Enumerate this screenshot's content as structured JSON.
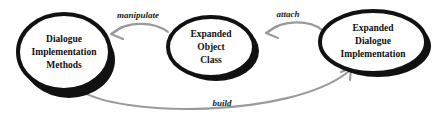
{
  "diagram": {
    "canvas": {
      "width": 432,
      "height": 125,
      "background": "#ffffff"
    },
    "style": {
      "node_stroke": "#111111",
      "node_fill": "#ffffff",
      "node_shadow": "#111111",
      "edge_color": "#9a9a9a",
      "text_color": "#101010"
    },
    "nodes": [
      {
        "id": "dialogue-implementation-methods",
        "shape": "ellipse",
        "cx": 64,
        "cy": 52,
        "rx": 46,
        "ry": 38,
        "lines": [
          "Dialogue",
          "Implementation",
          "Methods"
        ],
        "font_size": 9.5
      },
      {
        "id": "expanded-object-class",
        "shape": "ellipse",
        "cx": 211,
        "cy": 47,
        "rx": 43,
        "ry": 30,
        "lines": [
          "Expanded",
          "Object",
          "Class"
        ],
        "font_size": 9.5
      },
      {
        "id": "expanded-dialogue-implementation",
        "shape": "ellipse",
        "cx": 373,
        "cy": 42,
        "rx": 53,
        "ry": 31,
        "lines": [
          "Expanded",
          "Dialogue",
          "Implementation"
        ],
        "font_size": 9.5
      }
    ],
    "edges": [
      {
        "id": "manipulate",
        "label": "manipulate",
        "from": "expanded-object-class",
        "to": "dialogue-implementation-methods",
        "label_x": 138,
        "label_y": 16,
        "label_font_size": 9,
        "path": "M 168 32 C 155 22 128 20 113 33",
        "arrow": "M 122 27 L 111 34 L 123 39"
      },
      {
        "id": "attach",
        "label": "attach",
        "from": "expanded-dialogue-implementation",
        "to": "expanded-object-class",
        "label_x": 288,
        "label_y": 15,
        "label_font_size": 9,
        "path": "M 322 30 C 310 20 283 19 268 32",
        "arrow": "M 277 26 L 266 33 L 278 38"
      },
      {
        "id": "build",
        "label": "build",
        "from": "dialogue-implementation-methods",
        "to": "expanded-dialogue-implementation",
        "label_x": 222,
        "label_y": 104,
        "label_font_size": 9,
        "path": "M 78 89 C 118 118 290 118 348 72",
        "arrow": "M 341 72 L 351 68 L 350 80"
      }
    ]
  }
}
